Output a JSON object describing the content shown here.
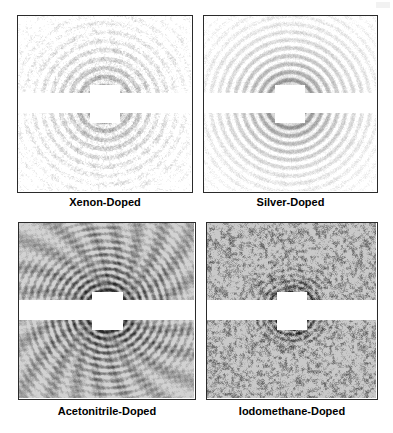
{
  "figure": {
    "background_color": "#ffffff",
    "panel_border_color": "#2b2b2b",
    "caption_color": "#000000",
    "caption_font_size_px": 11,
    "columns": 2,
    "rows": 2
  },
  "panels": [
    {
      "id": "xenon",
      "caption": "Xenon-Doped",
      "position": {
        "x": 17,
        "y": 15,
        "width": 176,
        "height": 178
      },
      "caption_y": 196,
      "gap_band": {
        "y_frac": 0.44,
        "height_frac": 0.115
      },
      "beamstop": {
        "cx_frac": 0.5,
        "cy_frac": 0.5,
        "w_frac": 0.175,
        "h_frac": 0.215,
        "arm_frac": 0.58
      },
      "pattern": {
        "style": "speckled-rings",
        "background": "#ffffff",
        "ring_color": "#6e6e6e",
        "ring_count": 16,
        "ring_spacing": 9,
        "ring_softness": 2.6,
        "intensity": 0.46,
        "noise_amount": 0.3,
        "noise_scale": 1.6,
        "speckle": 0.85,
        "moire": 0.22,
        "moire_freq": 0.4,
        "radial_streaks": 0.1,
        "vignette": -0.1,
        "center_dark": 0.55
      }
    },
    {
      "id": "silver",
      "caption": "Silver-Doped",
      "position": {
        "x": 203,
        "y": 15,
        "width": 175,
        "height": 178
      },
      "caption_y": 196,
      "gap_band": {
        "y_frac": 0.44,
        "height_frac": 0.115
      },
      "beamstop": {
        "cx_frac": 0.5,
        "cy_frac": 0.5,
        "w_frac": 0.175,
        "h_frac": 0.215,
        "arm_frac": 0.58
      },
      "pattern": {
        "style": "sharp-rings",
        "background": "#ffffff",
        "ring_color": "#5d5d5d",
        "ring_count": 18,
        "ring_spacing": 8,
        "ring_softness": 1.5,
        "intensity": 0.58,
        "noise_amount": 0.22,
        "noise_scale": 1.4,
        "speckle": 0.45,
        "moire": 0.06,
        "moire_freq": 0.22,
        "radial_streaks": 0.05,
        "vignette": -0.06,
        "center_dark": 0.7
      }
    },
    {
      "id": "acetonitrile",
      "caption": "Acetonitrile-Doped",
      "position": {
        "x": 18,
        "y": 222,
        "width": 178,
        "height": 178
      },
      "caption_y": 405,
      "gap_band": {
        "y_frac": 0.44,
        "height_frac": 0.115
      },
      "beamstop": {
        "cx_frac": 0.5,
        "cy_frac": 0.5,
        "w_frac": 0.175,
        "h_frac": 0.215,
        "arm_frac": 0.58
      },
      "pattern": {
        "style": "moire-rings",
        "background": "#d2d2d2",
        "ring_color": "#2a2a2a",
        "ring_count": 26,
        "ring_spacing": 7,
        "ring_softness": 1.2,
        "intensity": 0.8,
        "noise_amount": 0.2,
        "noise_scale": 1.2,
        "speckle": 0.35,
        "moire": 0.85,
        "moire_freq": 1.05,
        "radial_streaks": 0.55,
        "vignette": 0.1,
        "center_dark": 0.95
      }
    },
    {
      "id": "iodomethane",
      "caption": "Iodomethane-Doped",
      "position": {
        "x": 206,
        "y": 222,
        "width": 172,
        "height": 178
      },
      "caption_y": 405,
      "gap_band": {
        "y_frac": 0.44,
        "height_frac": 0.115
      },
      "beamstop": {
        "cx_frac": 0.5,
        "cy_frac": 0.5,
        "w_frac": 0.175,
        "h_frac": 0.215,
        "arm_frac": 0.58
      },
      "pattern": {
        "style": "grainy-rings",
        "background": "#c9c9c9",
        "ring_color": "#1e1e1e",
        "ring_count": 13,
        "ring_spacing": 6,
        "ring_softness": 1.0,
        "intensity": 0.92,
        "noise_amount": 0.62,
        "noise_scale": 2.8,
        "speckle": 1.0,
        "moire": 0.18,
        "moire_freq": 0.55,
        "radial_streaks": 0.12,
        "vignette": 0.14,
        "center_dark": 1.0,
        "ring_falloff": 2.2
      }
    }
  ]
}
